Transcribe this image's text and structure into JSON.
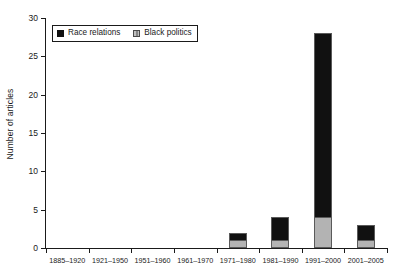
{
  "chart_data": {
    "type": "bar",
    "stacked": true,
    "title": "",
    "subtitle": "",
    "xlabel": "",
    "ylabel": "Number of articles",
    "categories": [
      "1885–1920",
      "1921–1950",
      "1951–1960",
      "1961–1970",
      "1971–1980",
      "1981–1990",
      "1991–2000",
      "2001–2005"
    ],
    "series": [
      {
        "name": "Black politics",
        "color": "#b3b3b3",
        "values": [
          0,
          0,
          0,
          0,
          1,
          1,
          4,
          1
        ]
      },
      {
        "name": "Race relations",
        "color": "#111111",
        "values": [
          0,
          0,
          0,
          0,
          1,
          3,
          24,
          2
        ]
      }
    ],
    "totals": [
      0,
      0,
      0,
      0,
      2,
      4,
      28,
      3
    ],
    "ylim": [
      0,
      30
    ],
    "yticks": [
      "0",
      "5",
      "10",
      "15",
      "20",
      "25",
      "30"
    ],
    "ytick_values": [
      0,
      5,
      10,
      15,
      20,
      25,
      30
    ],
    "grid": false,
    "legend": {
      "position": "top-left",
      "entries": [
        {
          "label": "Race relations",
          "swatch": "black-square"
        },
        {
          "label": "Black politics",
          "swatch": "gray-hatched-square"
        }
      ]
    }
  }
}
